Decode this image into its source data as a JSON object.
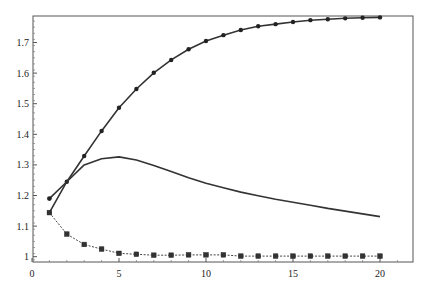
{
  "chart_data": {
    "type": "line",
    "title": "",
    "xlabel": "",
    "ylabel": "",
    "xlim": [
      0,
      22
    ],
    "ylim": [
      0.985,
      1.79
    ],
    "grid": false,
    "legend": null,
    "x_ticks": [
      0,
      5,
      10,
      15,
      20
    ],
    "x_tick_labels": [
      "0",
      "5",
      "10",
      "15",
      "20"
    ],
    "y_ticks": [
      1,
      1.1,
      1.2,
      1.3,
      1.4,
      1.5,
      1.6,
      1.7
    ],
    "y_tick_labels": [
      "1",
      "1.1",
      "1.2",
      "1.3",
      "1.4",
      "1.5",
      "1.6",
      "1.7"
    ],
    "series": [
      {
        "name": "rising-series",
        "style": "solid line with filled circle markers",
        "color": "#333333",
        "x": [
          1,
          2,
          3,
          4,
          5,
          6,
          7,
          8,
          9,
          10,
          11,
          12,
          13,
          14,
          15,
          16,
          17,
          18,
          19,
          20
        ],
        "values": [
          1.144,
          1.245,
          1.329,
          1.411,
          1.487,
          1.548,
          1.601,
          1.643,
          1.678,
          1.705,
          1.724,
          1.741,
          1.753,
          1.76,
          1.767,
          1.773,
          1.776,
          1.779,
          1.781,
          1.782
        ]
      },
      {
        "name": "peaked-series",
        "style": "solid line, no markers",
        "color": "#333333",
        "x": [
          1,
          2,
          3,
          4,
          5,
          6,
          7,
          8,
          9,
          10,
          11,
          12,
          13,
          14,
          15,
          16,
          17,
          18,
          19,
          20
        ],
        "values": [
          1.19,
          1.245,
          1.3,
          1.32,
          1.326,
          1.316,
          1.298,
          1.278,
          1.258,
          1.24,
          1.225,
          1.211,
          1.199,
          1.188,
          1.178,
          1.168,
          1.158,
          1.149,
          1.14,
          1.131
        ]
      },
      {
        "name": "decaying-series",
        "style": "dotted line with square markers",
        "color": "#444444",
        "x": [
          1,
          2,
          3,
          4,
          5,
          6,
          7,
          8,
          9,
          10,
          11,
          12,
          13,
          14,
          15,
          16,
          17,
          18,
          19,
          20
        ],
        "values": [
          1.144,
          1.074,
          1.04,
          1.025,
          1.011,
          1.008,
          1.005,
          1.005,
          1.006,
          1.006,
          1.006,
          1.002,
          1.002,
          1.002,
          1.002,
          1.002,
          1.002,
          1.002,
          1.002,
          1.002
        ]
      }
    ],
    "start_marker": {
      "x": 1,
      "value": 1.19,
      "style": "filled circle",
      "series": "peaked-series"
    }
  }
}
